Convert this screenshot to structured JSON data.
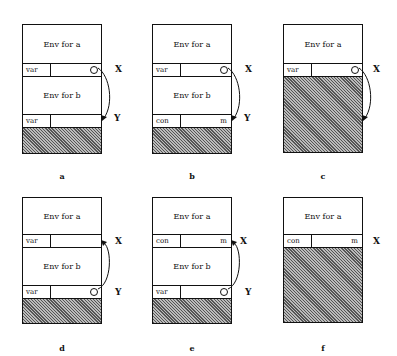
{
  "panels": [
    {
      "id": "a",
      "caption": "a",
      "env_a": "Env for a",
      "row_x": {
        "tag": "var",
        "value": ""
      },
      "env_b": "Env for b",
      "row_y": {
        "tag": "var",
        "value": ""
      },
      "label_x": "X",
      "label_y": "Y"
    },
    {
      "id": "b",
      "caption": "b",
      "env_a": "Env for a",
      "row_x": {
        "tag": "var",
        "value": ""
      },
      "env_b": "Env for b",
      "row_y": {
        "tag": "con",
        "value": "m"
      },
      "label_x": "X",
      "label_y": "Y"
    },
    {
      "id": "c",
      "caption": "c",
      "env_a": "Env for a",
      "row_x": {
        "tag": "var",
        "value": ""
      },
      "label_x": "X"
    },
    {
      "id": "d",
      "caption": "d",
      "env_a": "Env for a",
      "row_x": {
        "tag": "var",
        "value": ""
      },
      "env_b": "Env for b",
      "row_y": {
        "tag": "var",
        "value": ""
      },
      "label_x": "X",
      "label_y": "Y"
    },
    {
      "id": "e",
      "caption": "e",
      "env_a": "Env for a",
      "row_x": {
        "tag": "con",
        "value": "m"
      },
      "env_b": "Env for b",
      "row_y": {
        "tag": "var",
        "value": ""
      },
      "label_x": "X",
      "label_y": "Y"
    },
    {
      "id": "f",
      "caption": "f",
      "env_a": "Env for a",
      "row_x": {
        "tag": "con",
        "value": "m"
      },
      "label_x": "X"
    }
  ]
}
